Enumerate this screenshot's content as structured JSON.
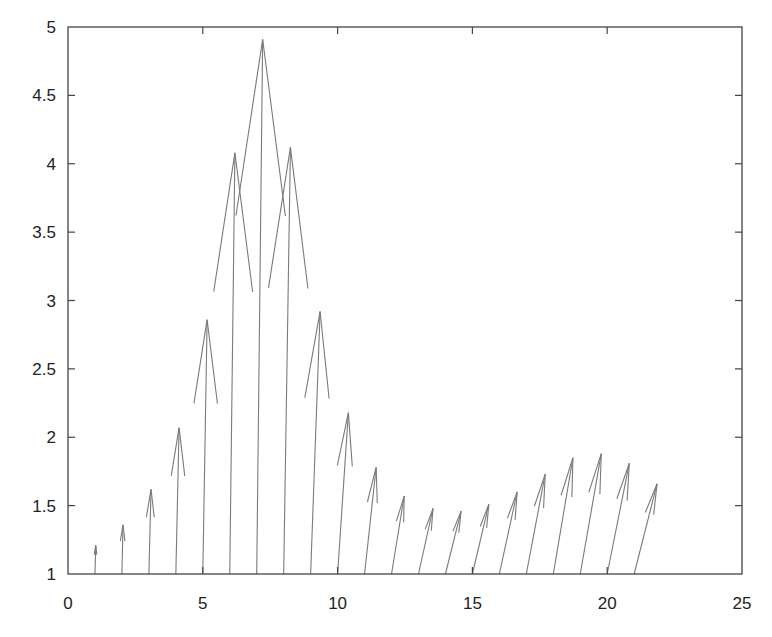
{
  "chart_data": {
    "type": "quiver",
    "title": "",
    "xlabel": "",
    "ylabel": "",
    "xlim": [
      0,
      25
    ],
    "ylim": [
      1,
      5
    ],
    "xticks": [
      0,
      5,
      10,
      15,
      20,
      25
    ],
    "yticks": [
      1,
      1.5,
      2,
      2.5,
      3,
      3.5,
      4,
      4.5,
      5
    ],
    "xtick_labels": [
      "0",
      "5",
      "10",
      "15",
      "20",
      "25"
    ],
    "ytick_labels": [
      "1",
      "1.5",
      "2",
      "2.5",
      "3",
      "3.5",
      "4",
      "4.5",
      "5"
    ],
    "grid": false,
    "legend": null,
    "arrow_color": "#7a7a7a",
    "axis_color": "#444444",
    "arrows": [
      {
        "x0": 1,
        "y0": 1,
        "x1": 1.03,
        "y1": 1.21
      },
      {
        "x0": 2,
        "y0": 1,
        "x1": 2.04,
        "y1": 1.36
      },
      {
        "x0": 3,
        "y0": 1,
        "x1": 3.08,
        "y1": 1.62
      },
      {
        "x0": 4,
        "y0": 1,
        "x1": 4.12,
        "y1": 2.07
      },
      {
        "x0": 5,
        "y0": 1,
        "x1": 5.16,
        "y1": 2.86
      },
      {
        "x0": 6,
        "y0": 1,
        "x1": 6.19,
        "y1": 4.08
      },
      {
        "x0": 7,
        "y0": 1,
        "x1": 7.22,
        "y1": 4.91
      },
      {
        "x0": 8,
        "y0": 1,
        "x1": 8.25,
        "y1": 4.12
      },
      {
        "x0": 9,
        "y0": 1,
        "x1": 9.35,
        "y1": 2.92
      },
      {
        "x0": 10,
        "y0": 1,
        "x1": 10.4,
        "y1": 2.18
      },
      {
        "x0": 11,
        "y0": 1,
        "x1": 11.43,
        "y1": 1.78
      },
      {
        "x0": 12,
        "y0": 1,
        "x1": 12.47,
        "y1": 1.57
      },
      {
        "x0": 13,
        "y0": 1,
        "x1": 13.54,
        "y1": 1.48
      },
      {
        "x0": 14,
        "y0": 1,
        "x1": 14.58,
        "y1": 1.46
      },
      {
        "x0": 15,
        "y0": 1,
        "x1": 15.61,
        "y1": 1.51
      },
      {
        "x0": 16,
        "y0": 1,
        "x1": 16.66,
        "y1": 1.6
      },
      {
        "x0": 17,
        "y0": 1,
        "x1": 17.7,
        "y1": 1.73
      },
      {
        "x0": 18,
        "y0": 1,
        "x1": 18.73,
        "y1": 1.85
      },
      {
        "x0": 19,
        "y0": 1,
        "x1": 19.78,
        "y1": 1.88
      },
      {
        "x0": 20,
        "y0": 1,
        "x1": 20.82,
        "y1": 1.81
      },
      {
        "x0": 21,
        "y0": 1,
        "x1": 21.85,
        "y1": 1.66
      }
    ]
  }
}
